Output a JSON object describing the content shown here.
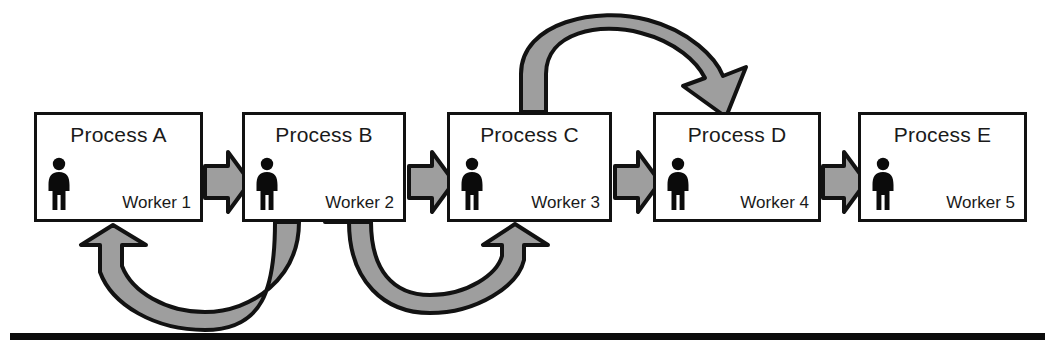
{
  "diagram": {
    "colors": {
      "arrow_fill": "#9e9e9e",
      "arrow_stroke": "#121212",
      "box_stroke": "#111111",
      "box_fill": "#ffffff",
      "text": "#1a1a1a",
      "rule": "#0b0b0b"
    },
    "processes": [
      {
        "id": "a",
        "title": "Process A",
        "worker": "Worker 1",
        "x": 34,
        "y": 112,
        "w": 169,
        "h": 110
      },
      {
        "id": "b",
        "title": "Process B",
        "worker": "Worker 2",
        "x": 242,
        "y": 112,
        "w": 164,
        "h": 110
      },
      {
        "id": "c",
        "title": "Process C",
        "worker": "Worker 3",
        "x": 447,
        "y": 112,
        "w": 165,
        "h": 110
      },
      {
        "id": "d",
        "title": "Process D",
        "worker": "Worker 4",
        "x": 653,
        "y": 112,
        "w": 168,
        "h": 110
      },
      {
        "id": "e",
        "title": "Process E",
        "worker": "Worker 5",
        "x": 858,
        "y": 112,
        "w": 169,
        "h": 110
      }
    ],
    "straight_arrows": [
      {
        "id": "a-to-b",
        "from": "Process A",
        "to": "Process B",
        "x": 203,
        "y": 155,
        "w": 41,
        "h": 54
      },
      {
        "id": "b-to-c",
        "from": "Process B",
        "to": "Process C",
        "x": 406,
        "y": 155,
        "w": 43,
        "h": 54
      },
      {
        "id": "c-to-d",
        "from": "Process C",
        "to": "Process D",
        "x": 612,
        "y": 155,
        "w": 43,
        "h": 54
      },
      {
        "id": "d-to-e",
        "from": "Process D",
        "to": "Process E",
        "x": 821,
        "y": 155,
        "w": 39,
        "h": 54
      }
    ],
    "curved_arrows": [
      {
        "id": "c-over-to-d",
        "from": "Process C",
        "to": "Process D",
        "direction": "skip-forward-over-top"
      },
      {
        "id": "b-back-to-a",
        "from": "Process B",
        "to": "Process A",
        "direction": "rework-back-under"
      },
      {
        "id": "b-under-to-c",
        "from": "Process B",
        "to": "Process C",
        "direction": "forward-under"
      }
    ],
    "baseline_rule": {
      "x": 10,
      "y": 333,
      "w": 1035,
      "h": 7
    },
    "worker_icon_name": "worker-person-icon"
  }
}
